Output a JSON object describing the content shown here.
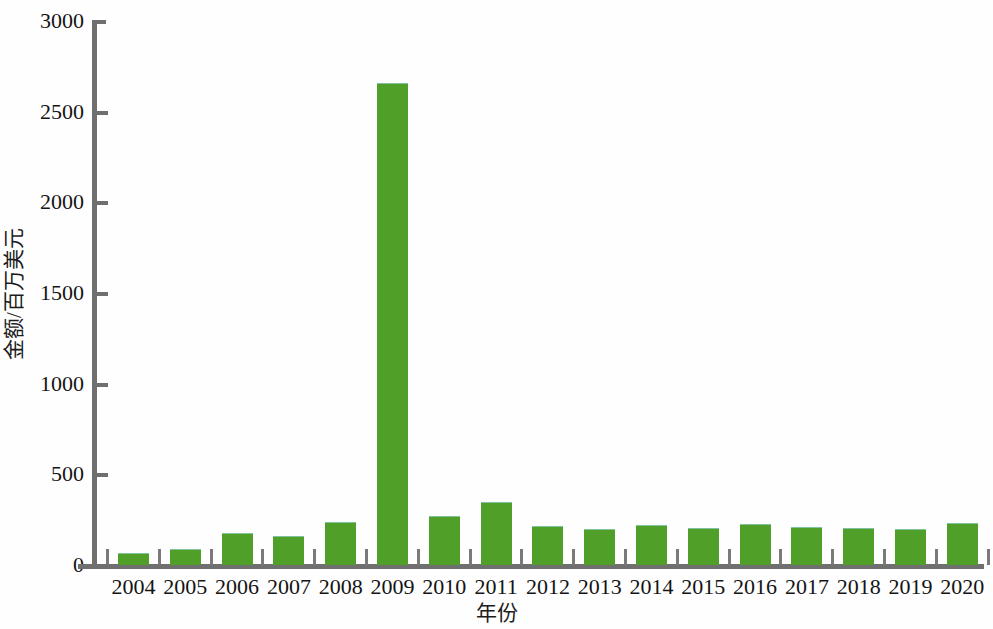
{
  "chart_data": {
    "type": "bar",
    "title": "",
    "subtitle": "",
    "xlabel": "年份",
    "ylabel": "金额/百万美元",
    "categories": [
      "2004",
      "2005",
      "2006",
      "2007",
      "2008",
      "2009",
      "2010",
      "2011",
      "2012",
      "2013",
      "2014",
      "2015",
      "2016",
      "2017",
      "2018",
      "2019",
      "2020"
    ],
    "values": [
      60,
      85,
      170,
      155,
      232,
      2650,
      262,
      340,
      210,
      193,
      215,
      198,
      220,
      205,
      200,
      193,
      228
    ],
    "series": [
      {
        "name": "金额/百万美元",
        "values": [
          60,
          85,
          170,
          155,
          232,
          2650,
          262,
          340,
          210,
          193,
          215,
          198,
          220,
          205,
          200,
          193,
          228
        ]
      }
    ],
    "ylim": [
      0,
      3000
    ],
    "y_ticks": [
      0,
      500,
      1000,
      1500,
      2000,
      2500,
      3000
    ],
    "y_tick_labels": [
      "0",
      "500",
      "1000",
      "1500",
      "2000",
      "2500",
      "3000"
    ],
    "grid": false,
    "legend": false,
    "legend_position": "none",
    "bar_color": "#4f9f28",
    "axis_color": "#6f6f6f",
    "background_color": "#ffffff"
  }
}
